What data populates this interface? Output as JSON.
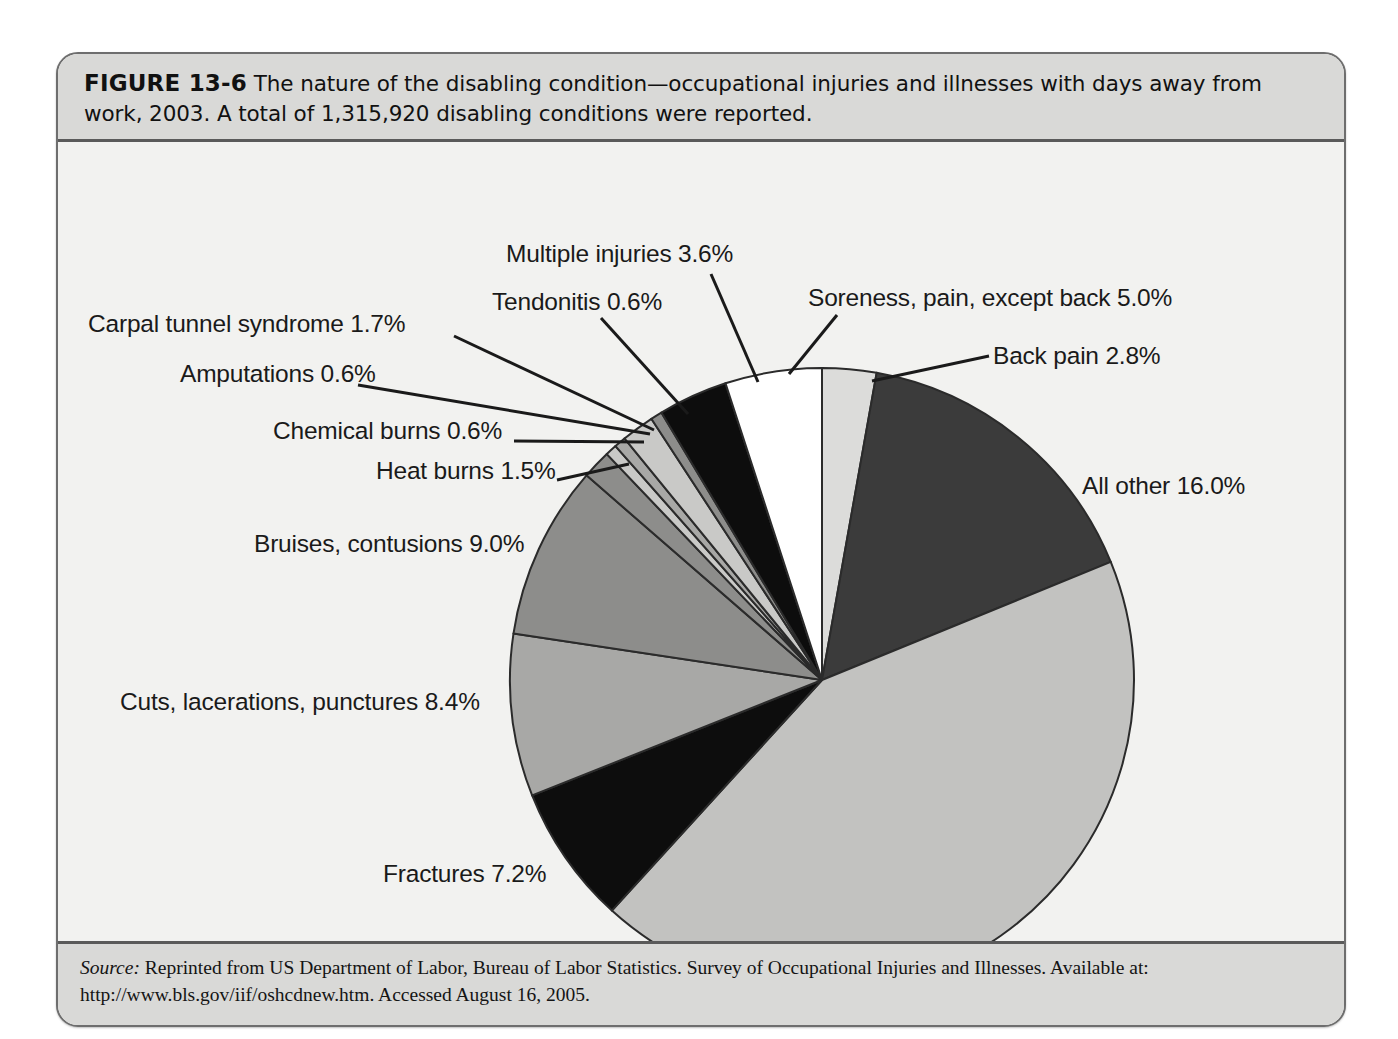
{
  "figure": {
    "number": "FIGURE 13-6",
    "caption": "The nature of the disabling condition—occupational injuries and illnesses with days away from work, 2003. A total of 1,315,920 disabling conditions were reported."
  },
  "source": {
    "keyword": "Source:",
    "text": " Reprinted from US Department of Labor, Bureau of Labor Statistics. Survey of Occupational Injuries and Illnesses. Available at: http://www.bls.gov/iif/oshcdnew.htm. Accessed August 16, 2005."
  },
  "labels": {
    "sprains": "Sprains, strains 42.9%",
    "all_other": "All other 16.0%",
    "bruises": "Bruises, contusions 9.0%",
    "cuts": "Cuts, lacerations, punctures 8.4%",
    "fractures": "Fractures 7.2%",
    "soreness": "Soreness, pain, except back 5.0%",
    "multiple": "Multiple injuries 3.6%",
    "back_pain": "Back pain 2.8%",
    "carpal": "Carpal tunnel syndrome 1.7%",
    "heat_burns": "Heat burns 1.5%",
    "tendonitis": "Tendonitis 0.6%",
    "amputations": "Amputations 0.6%",
    "chemical_burns": "Chemical burns 0.6%"
  },
  "chart_data": {
    "type": "pie",
    "title": "The nature of the disabling condition—occupational injuries and illnesses with days away from work, 2003",
    "total_label": "A total of 1,315,920 disabling conditions were reported.",
    "total_value": 1315920,
    "unit": "percent",
    "legend": "none (direct labels with leader lines)",
    "start_angle_deg": -90,
    "direction": "clockwise",
    "categories": [
      "Back pain",
      "All other",
      "Sprains, strains",
      "Fractures",
      "Cuts, lacerations, punctures",
      "Bruises, contusions",
      "Heat burns",
      "Chemical burns",
      "Amputations",
      "Carpal tunnel syndrome",
      "Tendonitis",
      "Multiple injuries",
      "Soreness, pain, except back"
    ],
    "values": [
      2.8,
      16.0,
      42.9,
      7.2,
      8.4,
      9.0,
      1.5,
      0.6,
      0.6,
      1.7,
      0.6,
      3.6,
      5.0
    ],
    "colors": [
      "#dcdcda",
      "#3b3b3b",
      "#c2c2c0",
      "#0d0d0d",
      "#a8a8a6",
      "#8d8d8b",
      "#8d8d8b",
      "#c9c9c7",
      "#a8a8a6",
      "#c9c9c7",
      "#8d8d8b",
      "#0d0d0d",
      "#ffffff"
    ],
    "slice_border": "#2b2b2b"
  }
}
